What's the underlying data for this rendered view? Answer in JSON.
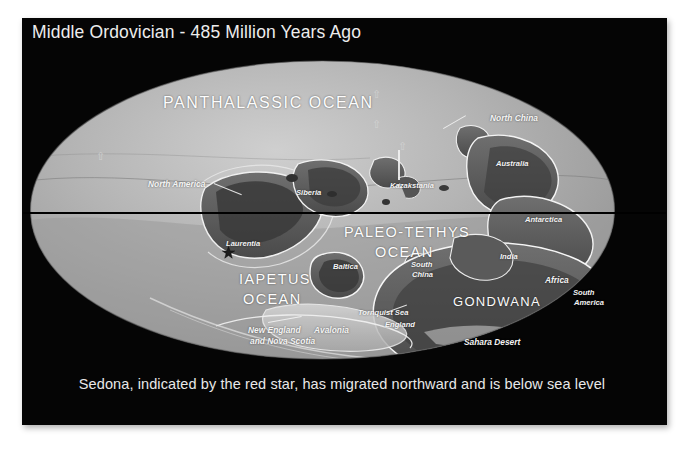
{
  "slide": {
    "title": "Middle Ordovician - 485 Million Years Ago",
    "caption": "Sedona, indicated by the red star, has migrated northward and is below sea level",
    "background_color": "#050505",
    "text_color": "#ededed",
    "star_color": "#c42020"
  },
  "map": {
    "projection": "mollweide-ellipse",
    "equator_line": true,
    "ocean_labels": [
      {
        "id": "panthalassic",
        "text": "PANTHALASSIC OCEAN",
        "x": 163,
        "y": 94
      },
      {
        "id": "paleo-tethys-1",
        "text": "PALEO-TETHYS",
        "x": 344,
        "y": 224
      },
      {
        "id": "paleo-tethys-2",
        "text": "OCEAN",
        "x": 375,
        "y": 244
      },
      {
        "id": "iapetus-1",
        "text": "IAPETUS",
        "x": 239,
        "y": 271
      },
      {
        "id": "iapetus-2",
        "text": "OCEAN",
        "x": 243,
        "y": 291
      }
    ],
    "region_labels": [
      {
        "id": "gondwana",
        "text": "GONDWANA",
        "x": 453,
        "y": 294
      }
    ],
    "terrane_labels": [
      {
        "id": "north-america",
        "text": "North America",
        "x": 148,
        "y": 180
      },
      {
        "id": "laurentia",
        "text": "Laurentia",
        "x": 226,
        "y": 240
      },
      {
        "id": "siberia",
        "text": "Siberia",
        "x": 296,
        "y": 189
      },
      {
        "id": "kazakstania",
        "text": "Kazakstania",
        "x": 390,
        "y": 182
      },
      {
        "id": "north-china",
        "text": "North China",
        "x": 490,
        "y": 114
      },
      {
        "id": "australia",
        "text": "Australia",
        "x": 496,
        "y": 160
      },
      {
        "id": "antarctica",
        "text": "Antarctica",
        "x": 525,
        "y": 216
      },
      {
        "id": "baltica",
        "text": "Baltica",
        "x": 333,
        "y": 263
      },
      {
        "id": "south-china-1",
        "text": "South",
        "x": 411,
        "y": 261
      },
      {
        "id": "south-china-2",
        "text": "China",
        "x": 412,
        "y": 271
      },
      {
        "id": "india",
        "text": "India",
        "x": 500,
        "y": 253
      },
      {
        "id": "africa",
        "text": "Africa",
        "x": 545,
        "y": 276
      },
      {
        "id": "south-america-1",
        "text": "South",
        "x": 573,
        "y": 289
      },
      {
        "id": "south-america-2",
        "text": "America",
        "x": 574,
        "y": 299
      },
      {
        "id": "tornquist-sea",
        "text": "Tornquist Sea",
        "x": 358,
        "y": 309
      },
      {
        "id": "england",
        "text": "England",
        "x": 385,
        "y": 321
      },
      {
        "id": "avalonia",
        "text": "Avalonia",
        "x": 314,
        "y": 326
      },
      {
        "id": "new-england-1",
        "text": "New England",
        "x": 248,
        "y": 326
      },
      {
        "id": "new-england-2",
        "text": "and Nova Scotia",
        "x": 250,
        "y": 337
      },
      {
        "id": "sahara-desert",
        "text": "Sahara Desert",
        "x": 464,
        "y": 338
      }
    ],
    "marker": {
      "id": "sedona-star",
      "label": "Sedona",
      "x": 222,
      "y": 246
    }
  }
}
